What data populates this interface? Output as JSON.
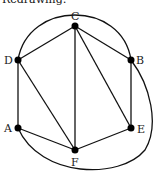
{
  "caption": "Redrawing:",
  "graph": {
    "nodes": [
      {
        "id": "C",
        "x": 75,
        "y": 26,
        "label": "C"
      },
      {
        "id": "D",
        "x": 18,
        "y": 60,
        "label": "D"
      },
      {
        "id": "B",
        "x": 131,
        "y": 60,
        "label": "B"
      },
      {
        "id": "A",
        "x": 18,
        "y": 128,
        "label": "A"
      },
      {
        "id": "E",
        "x": 131,
        "y": 128,
        "label": "E"
      },
      {
        "id": "F",
        "x": 75,
        "y": 150,
        "label": "F"
      }
    ],
    "edges": [
      [
        "C",
        "D"
      ],
      [
        "C",
        "B"
      ],
      [
        "C",
        "F"
      ],
      [
        "C",
        "E"
      ],
      [
        "D",
        "A"
      ],
      [
        "D",
        "F"
      ],
      [
        "B",
        "E"
      ],
      [
        "A",
        "F"
      ],
      [
        "F",
        "E"
      ],
      [
        "D",
        "B",
        "curved-top"
      ],
      [
        "A",
        "B",
        "curved-bottom-right"
      ]
    ]
  }
}
